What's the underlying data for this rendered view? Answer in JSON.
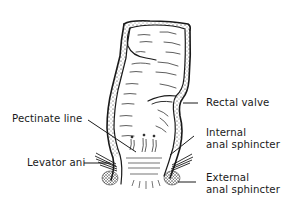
{
  "diagram": {
    "labels": {
      "rectal_valve": "Rectal valve",
      "pectinate_line": "Pectinate line",
      "internal_sphincter_line1": "Internal",
      "internal_sphincter_line2": "anal sphincter",
      "levator_ani": "Levator ani",
      "external_sphincter_line1": "External",
      "external_sphincter_line2": "anal sphincter"
    },
    "colors": {
      "ink": "#1a1a1a",
      "background": "#ffffff"
    }
  }
}
